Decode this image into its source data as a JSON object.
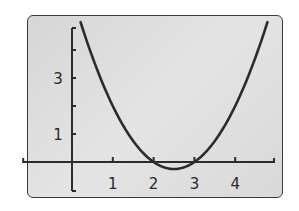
{
  "chart_data": {
    "type": "line",
    "title": "",
    "xlabel": "",
    "ylabel": "",
    "function": "y = x^2 - 5x + 6",
    "xlim": [
      -1,
      5
    ],
    "ylim": [
      -1,
      5
    ],
    "grid": false,
    "legend": null,
    "x_ticks": [
      1,
      2,
      3,
      4
    ],
    "x_tick_labels": [
      "1",
      "2",
      "3",
      "4"
    ],
    "y_ticks": [
      1,
      2,
      3,
      4
    ],
    "y_tick_labels": [
      "1",
      "3"
    ],
    "series": [
      {
        "name": "parabola",
        "x": [
          0.21,
          0.5,
          1.0,
          1.5,
          2.0,
          2.5,
          3.0,
          3.5,
          4.0,
          4.5,
          4.79
        ],
        "y": [
          5.0,
          3.75,
          2.0,
          0.75,
          0.0,
          -0.25,
          0.0,
          0.75,
          2.0,
          3.75,
          5.0
        ]
      }
    ],
    "roots": [
      2,
      3
    ],
    "vertex": [
      2.5,
      -0.25
    ],
    "colors": {
      "curve": "#2b2b2b",
      "axes": "#2b2b2b",
      "background": "#dcdcdc"
    }
  }
}
